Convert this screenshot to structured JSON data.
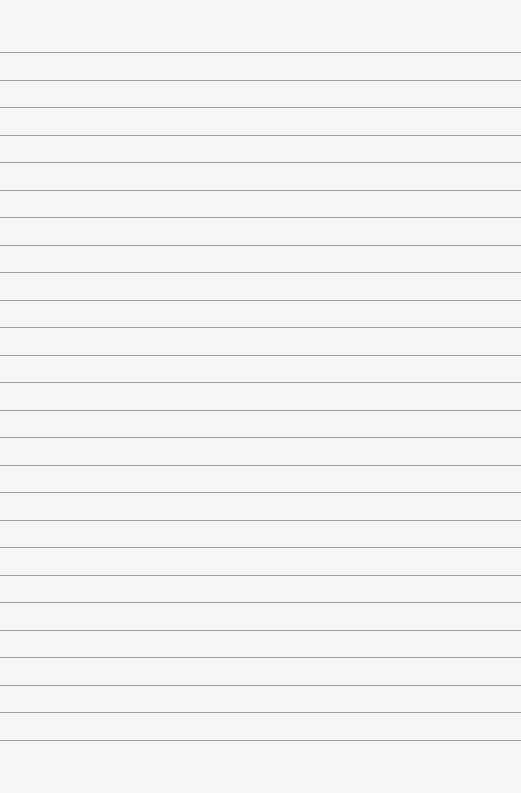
{
  "paper": {
    "type": "ruled-sheet",
    "line_count": 26,
    "first_line_y": 52,
    "line_spacing": 27.5,
    "background_color": "#f6f6f6",
    "line_color": "#8e8e8e",
    "text": ""
  }
}
